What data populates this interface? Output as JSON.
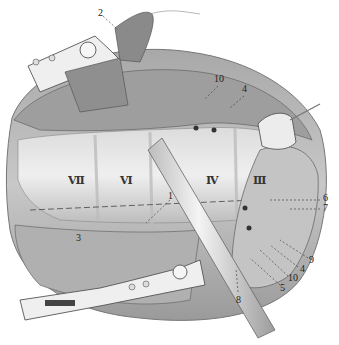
{
  "figure": {
    "type": "surgical anatomical illustration (grayscale pencil drawing)"
  },
  "colors": {
    "background": "#ffffff",
    "tissue_light": "#e4e4e4",
    "tissue_mid": "#b8b8b8",
    "tissue_dark": "#7a7a7a",
    "instrument": "#d6d6d6",
    "label_text": "#222222"
  },
  "roman_labels": [
    {
      "text": "Ⅶ",
      "x": 68,
      "y": 175
    },
    {
      "text": "Ⅵ",
      "x": 120,
      "y": 175
    },
    {
      "text": "Ⅳ",
      "x": 206,
      "y": 175
    },
    {
      "text": "Ⅲ",
      "x": 253,
      "y": 175
    }
  ],
  "number_labels": [
    {
      "text": "1",
      "x": 168,
      "y": 197
    },
    {
      "text": "2",
      "x": 100,
      "y": 12
    },
    {
      "text": "3",
      "x": 76,
      "y": 237
    },
    {
      "text": "4",
      "x": 243,
      "y": 88
    },
    {
      "text": "10",
      "x": 216,
      "y": 77
    },
    {
      "text": "6",
      "x": 324,
      "y": 196
    },
    {
      "text": "7",
      "x": 324,
      "y": 205
    },
    {
      "text": "9",
      "x": 310,
      "y": 256
    },
    {
      "text": "4",
      "x": 300,
      "y": 265
    },
    {
      "text": "10",
      "x": 289,
      "y": 274
    },
    {
      "text": "5",
      "x": 281,
      "y": 285
    },
    {
      "text": "8",
      "x": 237,
      "y": 297
    }
  ]
}
